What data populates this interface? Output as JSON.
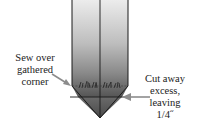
{
  "diagram": {
    "type": "sewing-instruction",
    "colors": {
      "fabric_top": "#e8e8e8",
      "fabric_mid": "#a8a8a8",
      "fabric_bottom": "#5a5a5a",
      "outline": "#1a1a1a",
      "arrow": "#8c8c8c"
    },
    "labels": {
      "left": [
        "Sew over",
        "gathered",
        "corner"
      ],
      "right": [
        "Cut away",
        "excess,",
        "leaving",
        "1/4˝"
      ]
    }
  }
}
